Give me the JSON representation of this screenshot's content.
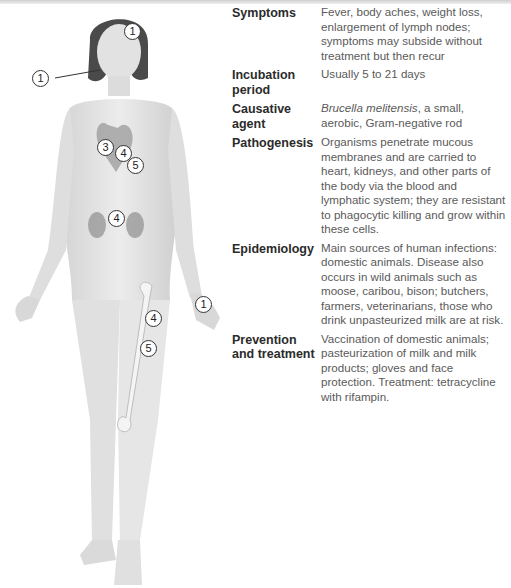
{
  "table": {
    "rows": [
      {
        "term": "Symptoms",
        "desc": "Fever, body aches, weight loss, enlargement of lymph nodes; symptoms may subside without treatment but then recur"
      },
      {
        "term": "Incubation period",
        "desc": "Usually 5 to 21 days"
      },
      {
        "term": "Causative agent",
        "desc_italic": "Brucella melitensis",
        "desc": ", a small, aerobic, Gram-negative rod"
      },
      {
        "term": "Pathogenesis",
        "desc": "Organisms penetrate mucous membranes and are carried to heart, kidneys, and other parts of the body via the blood and lymphatic system; they are resistant to phagocytic killing and grow within these cells."
      },
      {
        "term": "Epidemiology",
        "desc": "Main sources of human infections: domestic animals. Disease also occurs in wild animals such as moose, caribou, bison; butchers, farmers, veterinarians, those who drink unpasteurized milk are at risk."
      },
      {
        "term": "Prevention and treatment",
        "desc": "Vaccination of domestic animals; pasteurization of milk and milk products; gloves and face protection. Treatment: tetracycline with rifampin."
      }
    ]
  },
  "figure": {
    "markers": [
      {
        "label": "1",
        "site": "face"
      },
      {
        "label": "1",
        "site": "mouth"
      },
      {
        "label": "3",
        "site": "heart"
      },
      {
        "label": "4",
        "site": "heart"
      },
      {
        "label": "5",
        "site": "heart"
      },
      {
        "label": "4",
        "site": "kidneys"
      },
      {
        "label": "4",
        "site": "femur"
      },
      {
        "label": "5",
        "site": "femur"
      },
      {
        "label": "1",
        "site": "hand"
      }
    ]
  }
}
